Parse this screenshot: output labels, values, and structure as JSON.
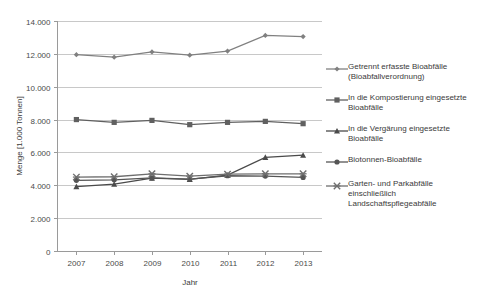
{
  "chart_data": {
    "type": "line",
    "title": "",
    "xlabel": "Jahr",
    "ylabel": "Menge [1.000 Tonnen]",
    "categories": [
      "2007",
      "2008",
      "2009",
      "2010",
      "2011",
      "2012",
      "2013"
    ],
    "x": [
      2007,
      2008,
      2009,
      2010,
      2011,
      2012,
      2013
    ],
    "ylim": [
      0,
      14000
    ],
    "yticks": [
      0,
      2000,
      4000,
      6000,
      8000,
      10000,
      12000,
      14000
    ],
    "ytick_labels": [
      "0",
      "2.000",
      "4.000",
      "6.000",
      "8.000",
      "10.000",
      "12.000",
      "14.000"
    ],
    "grid": true,
    "legend_position": "right",
    "series": [
      {
        "name": "Getrennt erfasste Bioabfälle (Bioabfallverordnung)",
        "marker": "diamond",
        "color": "#808080",
        "values": [
          11950,
          11800,
          12120,
          11920,
          12170,
          13120,
          13050
        ]
      },
      {
        "name": "In die Kompostierung eingesetzte Bioabfälle",
        "marker": "square",
        "color": "#606060",
        "values": [
          8000,
          7830,
          7950,
          7690,
          7830,
          7890,
          7750
        ]
      },
      {
        "name": "In die Vergärung eingesetzte Bioabfälle",
        "marker": "triangle",
        "color": "#4a4a4a",
        "values": [
          3920,
          4070,
          4430,
          4360,
          4620,
          5700,
          5830
        ]
      },
      {
        "name": "Biotonnen-Bioabfälle",
        "marker": "circle",
        "color": "#555555",
        "values": [
          4300,
          4330,
          4450,
          4380,
          4580,
          4560,
          4480
        ]
      },
      {
        "name": "Garten- und Parkabfälle einschließlich Landschaftspflegeabfälle",
        "marker": "cross",
        "color": "#6e6e6e",
        "values": [
          4500,
          4520,
          4700,
          4560,
          4680,
          4700,
          4700
        ]
      }
    ]
  },
  "legend": {
    "items": [
      {
        "label": "Getrennt erfasste Bioabfälle\n(Bioabfallverordnung)",
        "marker": "diamond-marker-icon"
      },
      {
        "label": "In die Kompostierung eingesetzte\nBioabfälle",
        "marker": "square-marker-icon"
      },
      {
        "label": "In die Vergärung eingesetzte\nBioabfälle",
        "marker": "triangle-marker-icon"
      },
      {
        "label": "Biotonnen-Bioabfälle",
        "marker": "circle-marker-icon"
      },
      {
        "label": "Garten- und Parkabfälle\neinschließlich\nLandschaftspflegeabfälle",
        "marker": "cross-marker-icon"
      }
    ]
  },
  "axes": {
    "y_title": "Menge [1.000 Tonnen]",
    "x_title": "Jahr",
    "y_labels": [
      "14.000",
      "12.000",
      "10.000",
      "8.000",
      "6.000",
      "4.000",
      "2.000",
      "0"
    ],
    "x_labels": [
      "2007",
      "2008",
      "2009",
      "2010",
      "2011",
      "2012",
      "2013"
    ]
  },
  "colors": {
    "grid": "#c8c8c8",
    "axis": "#9a9a9a",
    "text": "#3a3a3a",
    "background": "#ffffff"
  }
}
